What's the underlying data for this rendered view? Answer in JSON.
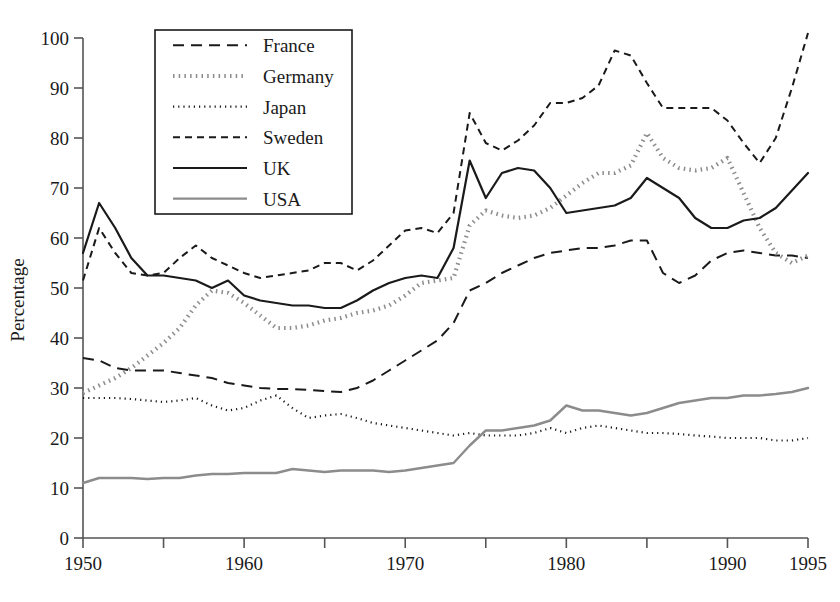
{
  "chart_data": {
    "type": "line",
    "title": "",
    "xlabel": "",
    "ylabel": "Percentage",
    "xlim": [
      1950,
      1995
    ],
    "ylim": [
      0,
      100
    ],
    "grid": false,
    "legend_position": "top-left-inside",
    "y_ticks": [
      0,
      10,
      20,
      30,
      40,
      50,
      60,
      70,
      80,
      90,
      100
    ],
    "x_ticks": [
      1950,
      1955,
      1960,
      1965,
      1970,
      1975,
      1980,
      1985,
      1990,
      1995
    ],
    "x_tick_labels": [
      "1950",
      "",
      "1960",
      "",
      "1970",
      "",
      "1980",
      "",
      "1990",
      "1995"
    ],
    "x": [
      1950,
      1951,
      1952,
      1953,
      1954,
      1955,
      1956,
      1957,
      1958,
      1959,
      1960,
      1961,
      1962,
      1963,
      1964,
      1965,
      1966,
      1967,
      1968,
      1969,
      1970,
      1971,
      1972,
      1973,
      1974,
      1975,
      1976,
      1977,
      1978,
      1979,
      1980,
      1981,
      1982,
      1983,
      1984,
      1985,
      1986,
      1987,
      1988,
      1989,
      1990,
      1991,
      1992,
      1993,
      1994,
      1995
    ],
    "series": [
      {
        "name": "France",
        "style": "long-dash",
        "color": "#1a1a1a",
        "width": 2.0,
        "dash": "11,7",
        "values": [
          36,
          35.5,
          34,
          33.5,
          33.5,
          33.5,
          33,
          32.5,
          32,
          31,
          30.5,
          30,
          29.8,
          29.8,
          29.6,
          29.4,
          29.2,
          30,
          31.5,
          33.5,
          35.5,
          37.5,
          39.5,
          43,
          49.5,
          51,
          53,
          54.5,
          56,
          57,
          57.5,
          58,
          58,
          58.5,
          59.5,
          59.5,
          53,
          51,
          52.5,
          55.5,
          57,
          57.5,
          57,
          56.5,
          56.5,
          56
        ]
      },
      {
        "name": "Germany",
        "style": "thick-dot",
        "color": "#8c8c8c",
        "width": 4.2,
        "dash": "1.5,4.2",
        "values": [
          29,
          30.5,
          32,
          34,
          36.5,
          39,
          42,
          46.5,
          49.5,
          49,
          47,
          44.5,
          42,
          42,
          42.5,
          43.5,
          44,
          45,
          45.5,
          46.5,
          48.5,
          51,
          51.5,
          52,
          62.5,
          65.5,
          64.5,
          64,
          64.5,
          66,
          68.5,
          71,
          73,
          73,
          74.5,
          81,
          76,
          74,
          73.5,
          74,
          76,
          69,
          62,
          57,
          55,
          56.5
        ]
      },
      {
        "name": "Japan",
        "style": "fine-dot",
        "color": "#1a1a1a",
        "width": 2.2,
        "dash": "1.2,4",
        "values": [
          28,
          28,
          28,
          27.8,
          27.5,
          27.2,
          27.5,
          28,
          26.5,
          25.5,
          26,
          27.5,
          28.5,
          26,
          24,
          24.5,
          24.8,
          24,
          23,
          22.5,
          22,
          21.5,
          21,
          20.5,
          21,
          20.5,
          20.5,
          20.5,
          21,
          22,
          21,
          22,
          22.5,
          22,
          21.5,
          21,
          21,
          20.8,
          20.5,
          20.3,
          20,
          20,
          20,
          19.5,
          19.5,
          20
        ]
      },
      {
        "name": "Sweden",
        "style": "med-dash",
        "color": "#1a1a1a",
        "width": 2.0,
        "dash": "7,5",
        "values": [
          51.5,
          62,
          57,
          53,
          52.5,
          53,
          56,
          58.5,
          56,
          54.5,
          53,
          52,
          52.5,
          53,
          53.5,
          55,
          55,
          53.5,
          55.5,
          58.5,
          61.5,
          62,
          61,
          65,
          85,
          79,
          77.5,
          79.5,
          82.5,
          87,
          87,
          88,
          90.5,
          97.5,
          96.5,
          91,
          86,
          86,
          86,
          86,
          83.5,
          79,
          75,
          80,
          90,
          101
        ]
      },
      {
        "name": "UK",
        "style": "solid",
        "color": "#1a1a1a",
        "width": 2.2,
        "dash": "",
        "values": [
          57,
          67,
          62,
          56,
          52.5,
          52.5,
          52,
          51.5,
          50,
          51.5,
          48.5,
          47.5,
          47,
          46.5,
          46.5,
          46,
          46,
          47.5,
          49.5,
          51,
          52,
          52.5,
          52,
          58,
          75.5,
          68,
          73,
          74,
          73.5,
          70,
          65,
          65.5,
          66,
          66.5,
          68,
          72,
          70,
          68,
          64,
          62,
          62,
          63.5,
          64,
          66,
          69.5,
          73
        ]
      },
      {
        "name": "USA",
        "style": "solid-gray",
        "color": "#8c8c8c",
        "width": 2.4,
        "dash": "",
        "values": [
          11,
          12,
          12,
          12,
          11.8,
          12,
          12,
          12.5,
          12.8,
          12.8,
          13,
          13,
          13,
          13.8,
          13.5,
          13.2,
          13.5,
          13.5,
          13.5,
          13.2,
          13.5,
          14,
          14.5,
          15,
          18.5,
          21.5,
          21.5,
          22,
          22.5,
          23.5,
          26.5,
          25.5,
          25.5,
          25,
          24.5,
          25,
          26,
          27,
          27.5,
          28,
          28,
          28.5,
          28.5,
          28.8,
          29.2,
          30
        ]
      }
    ]
  },
  "legend": {
    "entries": [
      {
        "label": "France"
      },
      {
        "label": "Germany"
      },
      {
        "label": "Japan"
      },
      {
        "label": "Sweden"
      },
      {
        "label": "UK"
      },
      {
        "label": "USA"
      }
    ]
  }
}
